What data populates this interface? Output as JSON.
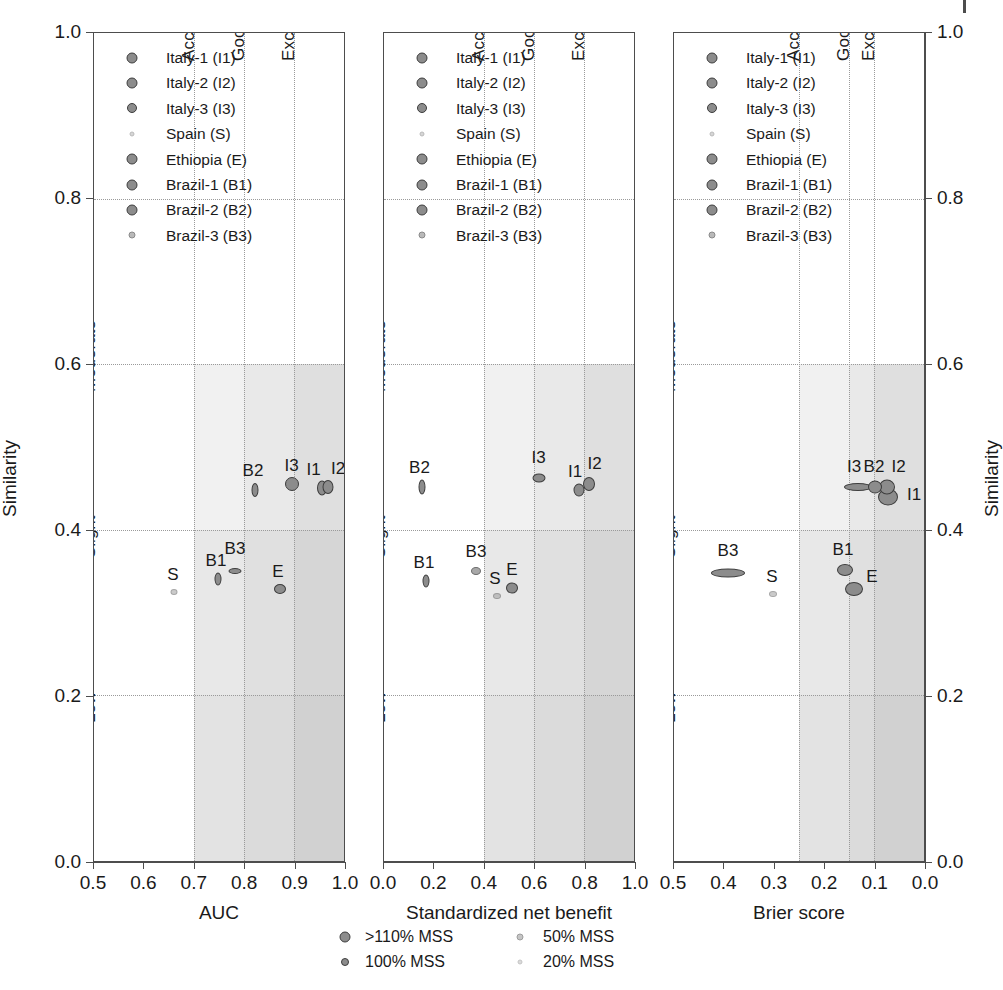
{
  "figure": {
    "y_axis_title": "Similarity",
    "y_ticks": [
      "0.0",
      "0.2",
      "0.4",
      "0.6",
      "0.8",
      "1.0"
    ],
    "y_band_labels": [
      "Low",
      "Slight",
      "Moderate"
    ],
    "quality_band_labels": [
      "Acceptable",
      "Good",
      "Excellent"
    ]
  },
  "series_legend": {
    "items": [
      {
        "label": "Italy-1 (I1)",
        "code": "I1",
        "marker": "circle-marker",
        "size": 9
      },
      {
        "label": "Italy-2 (I2)",
        "code": "I2",
        "marker": "circle-marker",
        "size": 9
      },
      {
        "label": "Italy-3 (I3)",
        "code": "I3",
        "marker": "circle-marker",
        "size": 8
      },
      {
        "label": "Spain (S)",
        "code": "S",
        "marker": "circle-marker",
        "size": 3
      },
      {
        "label": "Ethiopia (E)",
        "code": "E",
        "marker": "circle-marker",
        "size": 9
      },
      {
        "label": "Brazil-1 (B1)",
        "code": "B1",
        "marker": "circle-marker",
        "size": 9
      },
      {
        "label": "Brazil-2 (B2)",
        "code": "B2",
        "marker": "circle-marker",
        "size": 9
      },
      {
        "label": "Brazil-3 (B3)",
        "code": "B3",
        "marker": "circle-marker",
        "size": 5
      }
    ]
  },
  "size_legend": {
    "items": [
      {
        "label": ">110% MSS",
        "size": 9
      },
      {
        "label": "100% MSS",
        "size": 6
      },
      {
        "label": "50% MSS",
        "size": 5
      },
      {
        "label": "20% MSS",
        "size": 3
      }
    ]
  },
  "colors": {
    "marker_fill": "#8c8c8c",
    "marker_edge": "#3d3d3d",
    "axis": "#4d4d4d",
    "grid": "#9a9a9a",
    "shade_light": "#ededed",
    "shade_mid": "#e0e0e0",
    "shade_dark": "#d3d3d3",
    "shade_darker": "#c7c7c7"
  },
  "chart_data": [
    {
      "type": "scatter",
      "panel": 1,
      "title": "",
      "xlabel": "AUC",
      "ylabel": "Similarity",
      "xlim": [
        0.5,
        1.0
      ],
      "ylim": [
        0.0,
        1.0
      ],
      "x_ticks": [
        "0.5",
        "0.6",
        "0.7",
        "0.8",
        "0.9",
        "1.0"
      ],
      "x_reversed": false,
      "grid": true,
      "legend_position": "top-left",
      "quality_bands": [
        {
          "label": "Acceptable",
          "from": 0.7,
          "to": 0.8
        },
        {
          "label": "Good",
          "from": 0.8,
          "to": 0.9
        },
        {
          "label": "Excellent",
          "from": 0.9,
          "to": 1.0
        }
      ],
      "points": [
        {
          "code": "I1",
          "x": 0.955,
          "y": 0.45,
          "rx": 4.0,
          "ry": 6.5,
          "label_dx": -8,
          "label_dy": -28
        },
        {
          "code": "I2",
          "x": 0.968,
          "y": 0.452,
          "rx": 4.5,
          "ry": 6.0,
          "label_dx": 10,
          "label_dy": -28
        },
        {
          "code": "I3",
          "x": 0.895,
          "y": 0.455,
          "rx": 6.0,
          "ry": 6.0,
          "label_dx": 0,
          "label_dy": -28
        },
        {
          "code": "S",
          "x": 0.66,
          "y": 0.325,
          "rx": 2.5,
          "ry": 2.0,
          "label_dx": -1,
          "label_dy": -27
        },
        {
          "code": "E",
          "x": 0.872,
          "y": 0.328,
          "rx": 5.0,
          "ry": 4.0,
          "label_dx": -2,
          "label_dy": -27
        },
        {
          "code": "B1",
          "x": 0.748,
          "y": 0.34,
          "rx": 2.5,
          "ry": 5.5,
          "label_dx": -2,
          "label_dy": -28
        },
        {
          "code": "B2",
          "x": 0.822,
          "y": 0.448,
          "rx": 2.5,
          "ry": 6.0,
          "label_dx": -2,
          "label_dy": -29
        },
        {
          "code": "B3",
          "x": 0.782,
          "y": 0.35,
          "rx": 5.5,
          "ry": 2.0,
          "label_dx": 0,
          "label_dy": -32
        }
      ]
    },
    {
      "type": "scatter",
      "panel": 2,
      "title": "",
      "xlabel": "Standardized net benefit",
      "ylabel": "Similarity",
      "xlim": [
        0.0,
        1.0
      ],
      "ylim": [
        0.0,
        1.0
      ],
      "x_ticks": [
        "0.0",
        "0.2",
        "0.4",
        "0.6",
        "0.8",
        "1.0"
      ],
      "x_reversed": false,
      "grid": true,
      "legend_position": "top-left",
      "quality_bands": [
        {
          "label": "Acceptable",
          "from": 0.4,
          "to": 0.6
        },
        {
          "label": "Good",
          "from": 0.6,
          "to": 0.8
        },
        {
          "label": "Excellent",
          "from": 0.8,
          "to": 1.0
        }
      ],
      "points": [
        {
          "code": "I1",
          "x": 0.78,
          "y": 0.448,
          "rx": 4.5,
          "ry": 5.5,
          "label_dx": -4,
          "label_dy": -28
        },
        {
          "code": "I2",
          "x": 0.818,
          "y": 0.455,
          "rx": 5.0,
          "ry": 6.0,
          "label_dx": 6,
          "label_dy": -30
        },
        {
          "code": "I3",
          "x": 0.618,
          "y": 0.462,
          "rx": 5.5,
          "ry": 3.5,
          "label_dx": 0,
          "label_dy": -30
        },
        {
          "code": "S",
          "x": 0.452,
          "y": 0.32,
          "rx": 3.0,
          "ry": 2.0,
          "label_dx": -2,
          "label_dy": -27
        },
        {
          "code": "E",
          "x": 0.512,
          "y": 0.33,
          "rx": 5.0,
          "ry": 4.5,
          "label_dx": 0,
          "label_dy": -28
        },
        {
          "code": "B1",
          "x": 0.168,
          "y": 0.338,
          "rx": 2.5,
          "ry": 5.5,
          "label_dx": -2,
          "label_dy": -28
        },
        {
          "code": "B2",
          "x": 0.15,
          "y": 0.452,
          "rx": 2.5,
          "ry": 6.5,
          "label_dx": -2,
          "label_dy": -29
        },
        {
          "code": "B3",
          "x": 0.368,
          "y": 0.35,
          "rx": 4.0,
          "ry": 3.0,
          "label_dx": 0,
          "label_dy": -29
        }
      ]
    },
    {
      "type": "scatter",
      "panel": 3,
      "title": "",
      "xlabel": "Brier score",
      "ylabel": "Similarity",
      "xlim": [
        0.5,
        0.0
      ],
      "ylim": [
        0.0,
        1.0
      ],
      "x_ticks": [
        "0.5",
        "0.4",
        "0.3",
        "0.2",
        "0.1",
        "0.0"
      ],
      "x_reversed": true,
      "grid": true,
      "legend_position": "top-left",
      "quality_bands": [
        {
          "label": "Acceptable",
          "from": 0.25,
          "to": 0.15
        },
        {
          "label": "Good",
          "from": 0.15,
          "to": 0.1
        },
        {
          "label": "Excellent",
          "from": 0.1,
          "to": 0.0
        }
      ],
      "points": [
        {
          "code": "I1",
          "x": 0.072,
          "y": 0.44,
          "rx": 9.0,
          "ry": 7.5,
          "label_dx": 26,
          "label_dy": -12
        },
        {
          "code": "I2",
          "x": 0.075,
          "y": 0.452,
          "rx": 7.0,
          "ry": 6.5,
          "label_dx": 12,
          "label_dy": -30
        },
        {
          "code": "I3",
          "x": 0.132,
          "y": 0.452,
          "rx": 13.0,
          "ry": 3.0,
          "label_dx": -4,
          "label_dy": -30
        },
        {
          "code": "S",
          "x": 0.302,
          "y": 0.322,
          "rx": 3.0,
          "ry": 2.0,
          "label_dx": -1,
          "label_dy": -27
        },
        {
          "code": "E",
          "x": 0.14,
          "y": 0.328,
          "rx": 8.0,
          "ry": 6.0,
          "label_dx": 18,
          "label_dy": -22
        },
        {
          "code": "B1",
          "x": 0.158,
          "y": 0.352,
          "rx": 7.0,
          "ry": 5.0,
          "label_dx": -2,
          "label_dy": -30
        },
        {
          "code": "B2",
          "x": 0.098,
          "y": 0.452,
          "rx": 6.0,
          "ry": 5.5,
          "label_dx": -1,
          "label_dy": -30
        },
        {
          "code": "B3",
          "x": 0.392,
          "y": 0.348,
          "rx": 16.0,
          "ry": 3.5,
          "label_dx": 0,
          "label_dy": -32
        }
      ]
    }
  ]
}
